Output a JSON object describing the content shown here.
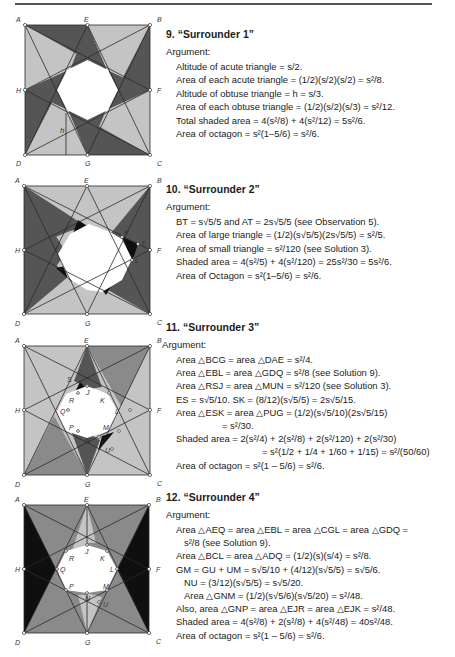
{
  "colors": {
    "light": "#c4c4c4",
    "medium": "#8a8a8a",
    "dark": "#555555",
    "black": "#0f0f0f",
    "stroke": "#2a2a2a",
    "rule": "#555555"
  },
  "figures": [
    {
      "id": "fig-9",
      "vertex_labels": {
        "A": "A",
        "B": "B",
        "C": "C",
        "D": "D",
        "E": "E",
        "F": "F",
        "G": "G",
        "H": "H"
      },
      "extra_labels": {
        "h": "h"
      }
    },
    {
      "id": "fig-10",
      "vertex_labels": {
        "A": "A",
        "B": "B",
        "C": "C",
        "D": "D",
        "E": "E",
        "F": "F",
        "G": "G",
        "H": "H"
      },
      "extra_labels": {
        "K": "K",
        "T": "T",
        "L": "L"
      }
    },
    {
      "id": "fig-11",
      "vertex_labels": {
        "A": "A",
        "B": "B",
        "C": "C",
        "D": "D",
        "E": "E",
        "F": "F",
        "G": "G",
        "H": "H"
      },
      "extra_labels": {
        "S": "S",
        "J": "J",
        "R": "R",
        "K": "K",
        "Q": "Q",
        "L": "L",
        "P": "P",
        "M": "M",
        "N": "N",
        "U": "U"
      }
    },
    {
      "id": "fig-12",
      "vertex_labels": {
        "A": "A",
        "B": "B",
        "C": "C",
        "D": "D",
        "E": "E",
        "F": "F",
        "G": "G",
        "H": "H"
      },
      "extra_labels": {
        "J": "J",
        "R": "R",
        "K": "K",
        "Q": "Q",
        "L": "L",
        "P": "P",
        "M": "M",
        "N": "N",
        "U": "U"
      }
    }
  ],
  "solutions": [
    {
      "title": "9. “Surrounder 1”",
      "argument_label": "Argument:",
      "lines": [
        "Altitude of acute triangle = s/2.",
        "Area of each acute triangle = (1/2)(s/2)(s/2) = s²/8.",
        "Altitude of obtuse triangle = h = s/3.",
        "Area of each obtuse triangle = (1/2)(s/2)(s/3) = s²/12.",
        "Total shaded area = 4(s²/8) + 4(s²/12) = 5s²/6.",
        "Area of octagon = s²(1–5/6) = s²/6."
      ]
    },
    {
      "title": "10. “Surrounder 2”",
      "argument_label": "Argument:",
      "lines": [
        "BT = s√5/5 and AT = 2s√5/5 (see Observation 5).",
        "Area of large triangle = (1/2)(s√5/5)(2s√5/5) = s²/5.",
        "Area of small triangle = s²/120 (see Solution 3).",
        "Shaded area = 4(s²/5) + 4(s²/120) = 25s²/30 = 5s²/6.",
        "Area of Octagon = s²(1–5/6) = s²/6."
      ]
    },
    {
      "title": "11. “Surrounder 3”",
      "argument_label": "Argument:",
      "lines": [
        "Area △BCG = area △DAE = s²/4.",
        "Area △EBL = area △GDQ = s²/8 (see Solution 9).",
        "Area △RSJ = area △MUN = s²/120 (see Solution 3).",
        "ES = s√5/10. SK = (8/12)(s√5/5) = 2s√5/15.",
        "Area △ESK = area △PUG = (1/2)(s√5/10)(2s√5/15)",
        "= s²/30.",
        "Shaded area = 2(s²/4) + 2(s²/8) + 2(s²/120) + 2(s²/30)",
        "= s²(1/2 + 1/4 + 1/60 + 1/15) = s²/(50/60)",
        "Area of octagon = s²(1 – 5/6) = s²/6."
      ]
    },
    {
      "title": "12. “Surrounder 4”",
      "argument_label": "Argument:",
      "lines": [
        "Area △AEQ = area △EBL = area △CGL = area △GDQ =",
        "s²/8 (see Solution 9).",
        "Area △BCL = area △ADQ = (1/2)(s)(s/4) = s²/8.",
        "GM = GU + UM = s√5/10 + (4/12)(s√5/5) = s√5/6.",
        "NU = (3/12)(s√5/5) = s√5/20.",
        "Area △GNM = (1/2)(s√5/6)(s√5/20) = s²/48.",
        "Also, area △GNP = area △EJR = area △EJK = s²/48.",
        "Shaded area = 4(s²/8) + 2(s²/8) + 4(s²/48) = 40s²/48.",
        "Area of octagon = s²(1 – 5/6) = s²/6."
      ]
    }
  ]
}
